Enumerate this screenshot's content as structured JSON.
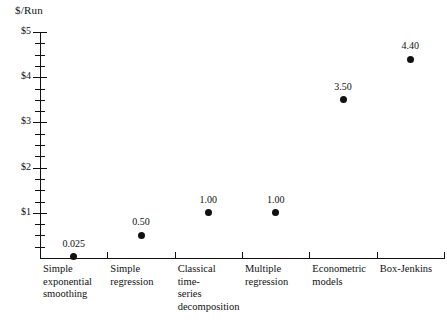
{
  "chart_data": {
    "type": "scatter",
    "title": "",
    "ylabel": "$/Run",
    "xlabel": "",
    "ylim": [
      0,
      5
    ],
    "grid": false,
    "legend": null,
    "y_tick_labels": [
      "$5",
      "$4",
      "$3",
      "$2",
      "$1"
    ],
    "y_tick_values": [
      5,
      4,
      3,
      2,
      1
    ],
    "y_minor_tick_step": 0.25,
    "categories": [
      "Simple\nexponential\nsmoothing",
      "Simple\nregression",
      "Classical\ntime-\nseries\ndecomposition",
      "Multiple\nregression",
      "Econometric\nmodels",
      "Box-Jenkins"
    ],
    "values": [
      0.025,
      0.5,
      1.0,
      1.0,
      3.5,
      4.4
    ],
    "point_labels": [
      "0.025",
      "0.50",
      "1.00",
      "1.00",
      "3.50",
      "4.40"
    ],
    "marker_color": "#111111",
    "axis_color": "#111111",
    "background_color": "#ffffff"
  },
  "axis": {
    "y_title": "$/Run"
  }
}
